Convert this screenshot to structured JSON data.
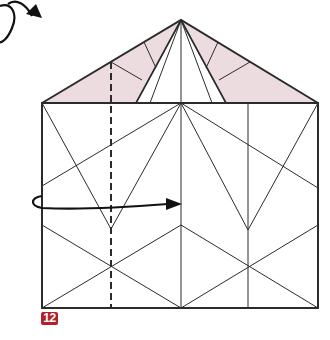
{
  "diagram": {
    "step_number": "12",
    "colors": {
      "line": "#2b2b2b",
      "flap_fill": "#ecdcdf",
      "step_badge": "#b3202a",
      "background": "#ffffff"
    },
    "symbols": [
      {
        "name": "turn-over-arrow",
        "meaning": "turn model over"
      },
      {
        "name": "fold-behind-arrow",
        "meaning": "fold left edge to center"
      },
      {
        "name": "valley-fold-line",
        "style": "dashed"
      }
    ]
  }
}
